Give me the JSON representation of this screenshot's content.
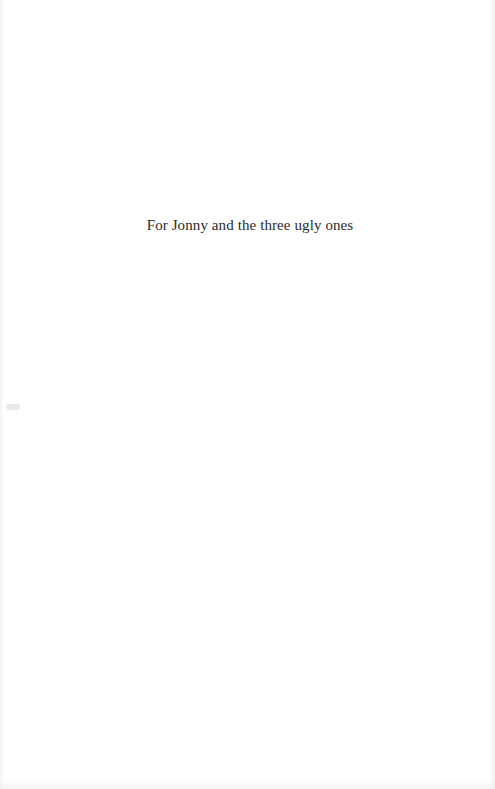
{
  "page": {
    "dedication": "For Jonny and the three ugly ones"
  },
  "colors": {
    "background": "#ffffff",
    "text": "#2a2a2a"
  }
}
